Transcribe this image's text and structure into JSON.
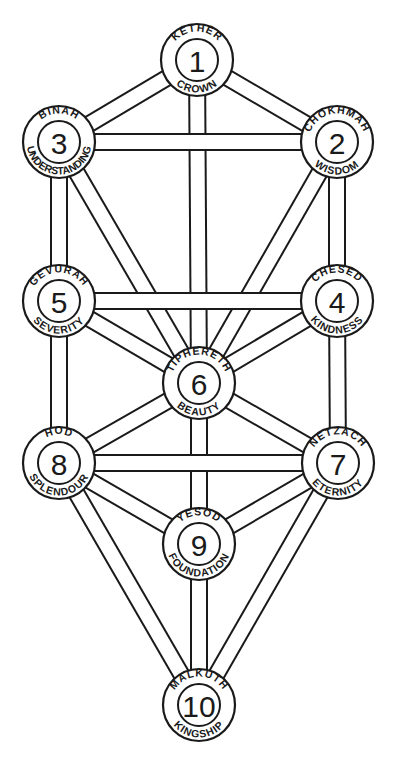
{
  "diagram": {
    "colors": {
      "line": "#1a1a1a",
      "background": "#ffffff"
    },
    "sephirot": [
      {
        "id": "kether",
        "number": "1",
        "name": "KETHER",
        "meaning": "CROWN",
        "x": 197,
        "y": 60
      },
      {
        "id": "chokhmah",
        "number": "2",
        "name": "CHOKHMAH",
        "meaning": "WISDOM",
        "x": 337,
        "y": 142
      },
      {
        "id": "binah",
        "number": "3",
        "name": "BINAH",
        "meaning": "UNDERSTANDING",
        "x": 59,
        "y": 142
      },
      {
        "id": "chesed",
        "number": "4",
        "name": "CHESED",
        "meaning": "KINDNESS",
        "x": 337,
        "y": 301
      },
      {
        "id": "gevurah",
        "number": "5",
        "name": "GEVURAH",
        "meaning": "SEVERITY",
        "x": 59,
        "y": 301
      },
      {
        "id": "tiphereth",
        "number": "6",
        "name": "TIPHERETH",
        "meaning": "BEAUTY",
        "x": 199,
        "y": 383
      },
      {
        "id": "netzach",
        "number": "7",
        "name": "NETZACH",
        "meaning": "ETERNITY",
        "x": 338,
        "y": 463
      },
      {
        "id": "hod",
        "number": "8",
        "name": "HOD",
        "meaning": "SPLENDOUR",
        "x": 59,
        "y": 463
      },
      {
        "id": "yesod",
        "number": "9",
        "name": "YESOD",
        "meaning": "FOUNDATION",
        "x": 199,
        "y": 544
      },
      {
        "id": "malkuth",
        "number": "10",
        "name": "MALKUTH",
        "meaning": "KINGSHIP",
        "x": 199,
        "y": 705
      }
    ],
    "paths": [
      [
        "kether",
        "chokhmah"
      ],
      [
        "kether",
        "binah"
      ],
      [
        "kether",
        "tiphereth"
      ],
      [
        "chokhmah",
        "binah"
      ],
      [
        "chokhmah",
        "chesed"
      ],
      [
        "chokhmah",
        "tiphereth"
      ],
      [
        "binah",
        "gevurah"
      ],
      [
        "binah",
        "tiphereth"
      ],
      [
        "chesed",
        "gevurah"
      ],
      [
        "chesed",
        "tiphereth"
      ],
      [
        "chesed",
        "netzach"
      ],
      [
        "gevurah",
        "tiphereth"
      ],
      [
        "gevurah",
        "hod"
      ],
      [
        "tiphereth",
        "netzach"
      ],
      [
        "tiphereth",
        "hod"
      ],
      [
        "tiphereth",
        "yesod"
      ],
      [
        "netzach",
        "hod"
      ],
      [
        "netzach",
        "yesod"
      ],
      [
        "netzach",
        "malkuth"
      ],
      [
        "hod",
        "yesod"
      ],
      [
        "hod",
        "malkuth"
      ],
      [
        "yesod",
        "malkuth"
      ]
    ]
  }
}
